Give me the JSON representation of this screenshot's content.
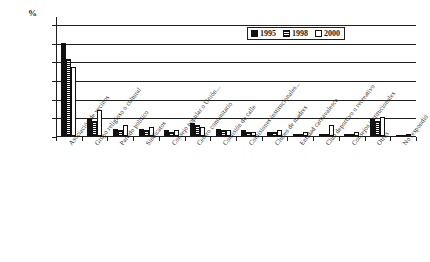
{
  "chart_data": {
    "type": "bar",
    "title": "",
    "subtitle": "",
    "xlabel": "",
    "ylabel": "%",
    "ylim": [
      0,
      60
    ],
    "yticks": [
      0,
      10,
      20,
      30,
      40,
      50,
      60
    ],
    "grid": true,
    "legend_position": "top-right",
    "categories": [
      "Asociación de vecinos",
      "Grupo religioso o cultural",
      "Partido político",
      "Sindicatos",
      "Consejo popular o Unión...",
      "Centro comunitario",
      "Comisión de calle",
      "Comisiones institucionales...",
      "Clubes de madres",
      "Entidad carnavalesca",
      "Club deportivo o recreativo",
      "Consejos institucionales",
      "Otros",
      "No respondió"
    ],
    "series": [
      {
        "name": "1995",
        "values": [
          50,
          9,
          4,
          4,
          3,
          7,
          4,
          3,
          2,
          1,
          1,
          1,
          9,
          0
        ]
      },
      {
        "name": "1998",
        "values": [
          41,
          8,
          3,
          3,
          2,
          6,
          3,
          2,
          2,
          1,
          1,
          1,
          8,
          0
        ]
      },
      {
        "name": "2000",
        "values": [
          37,
          14,
          6,
          5,
          3,
          5,
          3,
          2,
          3,
          2,
          6,
          2,
          10,
          1
        ]
      }
    ],
    "series_styles": [
      "solid-black",
      "horizontal-stripes",
      "white-empty"
    ]
  },
  "legend": {
    "items": [
      {
        "label": "1995",
        "style": "solid-black"
      },
      {
        "label": "1998",
        "style": "horizontal-stripes"
      },
      {
        "label": "2000",
        "style": "white-empty"
      }
    ]
  },
  "colors": {
    "axis": "#1f1f1f",
    "series_1995": "#111111",
    "series_1998_stripe": "#111111",
    "series_2000": "#ffffff",
    "background": "#ffffff"
  }
}
